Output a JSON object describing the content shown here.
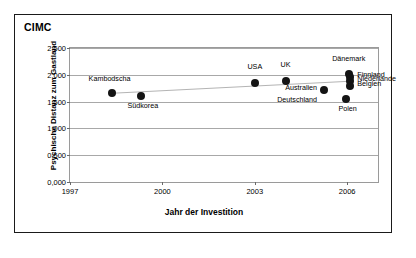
{
  "chart_data": {
    "type": "scatter",
    "title": "CIMC",
    "xlabel": "Jahr der Investition",
    "ylabel": "Psychische Distanz zum Gastland",
    "xlim": [
      1997,
      2007
    ],
    "ylim": [
      0.0,
      2.5
    ],
    "xticks": [
      "1997",
      "2000",
      "2003",
      "2006"
    ],
    "xtick_values": [
      1997,
      2000,
      2003,
      2006
    ],
    "yticks": [
      "0,000",
      "0,500",
      "1,000",
      "1,500",
      "2,000",
      "2,500"
    ],
    "ytick_values": [
      0.0,
      0.5,
      1.0,
      1.5,
      2.0,
      2.5
    ],
    "grid": true,
    "legend": "none",
    "points": [
      {
        "label": "Kambodscha",
        "x": 1998.35,
        "y": 1.665,
        "label_dx": -2,
        "label_dy": -15,
        "anchor": "center"
      },
      {
        "label": "Südkorea",
        "x": 1999.3,
        "y": 1.605,
        "label_dx": 2,
        "label_dy": 9,
        "anchor": "center"
      },
      {
        "label": "USA",
        "x": 2003.0,
        "y": 1.85,
        "label_dx": 0,
        "label_dy": -17,
        "anchor": "center"
      },
      {
        "label": "UK",
        "x": 2004.0,
        "y": 1.88,
        "label_dx": 0,
        "label_dy": -17,
        "anchor": "center"
      },
      {
        "label": "Australien",
        "x": 2005.25,
        "y": 1.715,
        "label_dx": -7,
        "label_dy": -3,
        "anchor": "right"
      },
      {
        "label": "Deutschland",
        "x": 2005.25,
        "y": 1.715,
        "label_dx": -7,
        "label_dy": 9,
        "anchor": "right",
        "hide_marker": true
      },
      {
        "label": "Dänemark",
        "x": 2006.05,
        "y": 2.01,
        "label_dx": 0,
        "label_dy": -16,
        "anchor": "center"
      },
      {
        "label": "Finnland",
        "x": 2006.1,
        "y": 1.955,
        "label_dx": 7,
        "label_dy": -3,
        "anchor": "left"
      },
      {
        "label": "Niederlande",
        "x": 2006.1,
        "y": 1.88,
        "label_dx": 7,
        "label_dy": -3,
        "anchor": "left"
      },
      {
        "label": "Belgien",
        "x": 2006.1,
        "y": 1.79,
        "label_dx": 7,
        "label_dy": -3,
        "anchor": "left"
      },
      {
        "label": "Polen",
        "x": 2005.95,
        "y": 1.555,
        "label_dx": 2,
        "label_dy": 9,
        "anchor": "center"
      }
    ],
    "trend": {
      "from": [
        1998.35,
        1.655
      ],
      "to": [
        2006.1,
        1.88
      ],
      "color": "#b4b4b4"
    },
    "marker_color": "#141414",
    "grid_color": "#a8a8a8",
    "axis_color": "#9a9a9a",
    "frame_color": "#1a1a1a"
  }
}
